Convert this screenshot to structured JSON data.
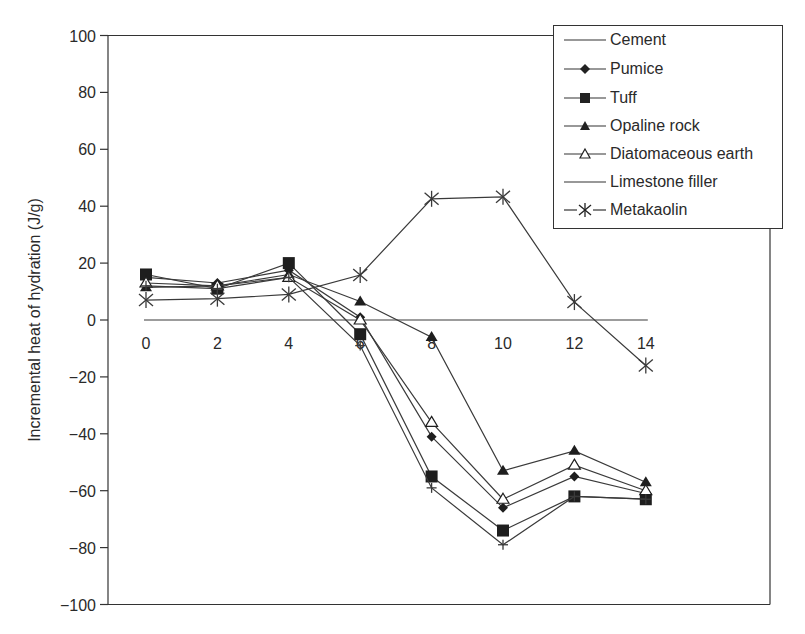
{
  "chart_data": {
    "type": "line",
    "title": "",
    "xlabel": "",
    "ylabel": "Incremental heat of hydration (J/g)",
    "x": [
      0,
      2,
      4,
      6,
      8,
      10,
      12,
      14
    ],
    "x_ticks": [
      "0",
      "2",
      "4",
      "6",
      "8",
      "10",
      "12",
      "14"
    ],
    "y_ticks": [
      "100",
      "80",
      "60",
      "40",
      "20",
      "0",
      "−20",
      "−40",
      "−60",
      "−80",
      "−100"
    ],
    "ylim": [
      -100,
      100
    ],
    "xlim": [
      -1,
      16
    ],
    "grid": false,
    "legend_position": "upper right",
    "series": [
      {
        "name": "Cement",
        "marker": "none",
        "values": [
          0,
          0,
          0,
          0,
          0,
          0,
          0,
          0
        ]
      },
      {
        "name": "Pumice",
        "marker": "diamond-filled",
        "values": [
          15,
          13,
          17.5,
          1,
          -41,
          -66,
          -55,
          -61
        ]
      },
      {
        "name": "Tuff",
        "marker": "square-filled",
        "values": [
          16,
          11,
          20,
          -5,
          -55,
          -74,
          -62,
          -63
        ]
      },
      {
        "name": "Opaline rock",
        "marker": "triangle-filled",
        "values": [
          11.5,
          12,
          16,
          6.5,
          -6,
          -53,
          -46,
          -57
        ]
      },
      {
        "name": "Diatomaceous earth",
        "marker": "triangle-open",
        "values": [
          13,
          12,
          15,
          0,
          -36,
          -63,
          -51,
          -60
        ]
      },
      {
        "name": "Limestone filler",
        "marker": "plus",
        "values": [
          12,
          11,
          15,
          -9,
          -59,
          -79,
          -62,
          -63
        ]
      },
      {
        "name": "Metakaolin",
        "marker": "asterisk",
        "values": [
          7,
          7.5,
          9,
          15.8,
          42.6,
          43.3,
          6.3,
          -16
        ]
      }
    ]
  },
  "legend": {
    "items": [
      {
        "label": "Cement"
      },
      {
        "label": "Pumice"
      },
      {
        "label": "Tuff"
      },
      {
        "label": "Opaline rock"
      },
      {
        "label": "Diatomaceous earth"
      },
      {
        "label": "Limestone filler"
      },
      {
        "label": "Metakaolin"
      }
    ]
  },
  "colors": {
    "line": "#3a3a3a",
    "axis": "#333333",
    "text": "#2a2a2a"
  }
}
